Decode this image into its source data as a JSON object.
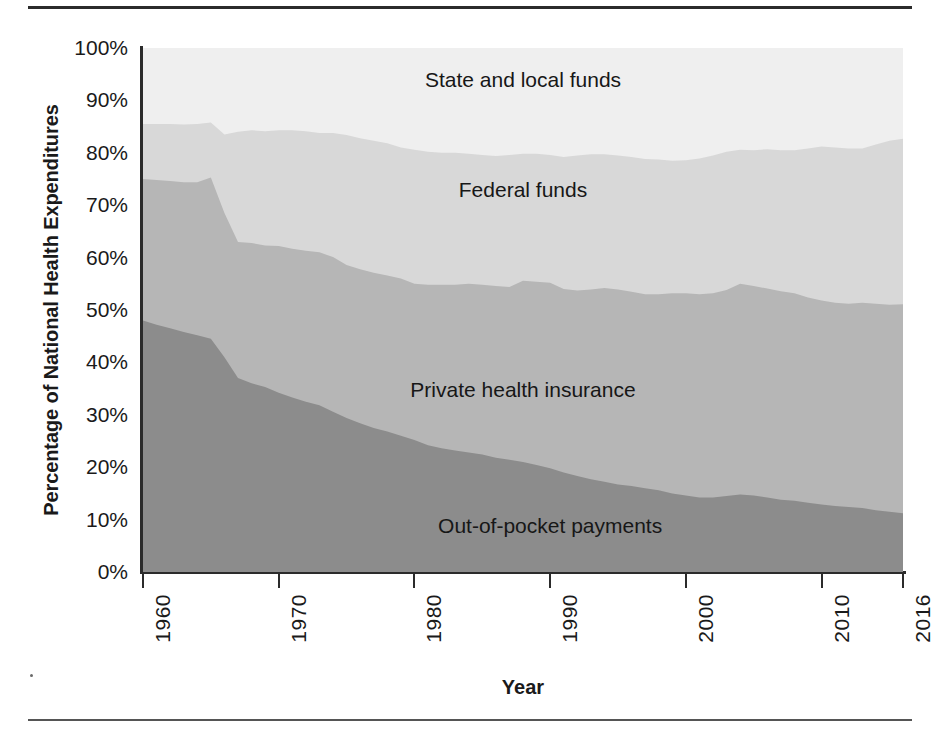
{
  "chart_data": {
    "type": "area",
    "stacked": true,
    "title": "",
    "subtitle": "",
    "xlabel": "Year",
    "ylabel": "Percentage of National Health Expenditures",
    "xlim": [
      1960,
      2016
    ],
    "ylim": [
      0,
      100
    ],
    "grid": false,
    "legend_position": "inline-labels",
    "y_tick_labels": [
      "0%",
      "10%",
      "20%",
      "30%",
      "40%",
      "50%",
      "60%",
      "70%",
      "80%",
      "90%",
      "100%"
    ],
    "y_tick_values": [
      0,
      10,
      20,
      30,
      40,
      50,
      60,
      70,
      80,
      90,
      100
    ],
    "x_tick_labels": [
      "1960",
      "1970",
      "1980",
      "1990",
      "2000",
      "2010",
      "2016"
    ],
    "x_tick_values": [
      1960,
      1970,
      1980,
      1990,
      2000,
      2010,
      2016
    ],
    "x": [
      1960,
      1961,
      1962,
      1963,
      1964,
      1965,
      1966,
      1967,
      1968,
      1969,
      1970,
      1971,
      1972,
      1973,
      1974,
      1975,
      1976,
      1977,
      1978,
      1979,
      1980,
      1981,
      1982,
      1983,
      1984,
      1985,
      1986,
      1987,
      1988,
      1989,
      1990,
      1991,
      1992,
      1993,
      1994,
      1995,
      1996,
      1997,
      1998,
      1999,
      2000,
      2001,
      2002,
      2003,
      2004,
      2005,
      2006,
      2007,
      2008,
      2009,
      2010,
      2011,
      2012,
      2013,
      2014,
      2015,
      2016
    ],
    "series": [
      {
        "name": "Out-of-pocket payments",
        "color": "#8c8c8c",
        "label_x": 1990,
        "label_y": 9,
        "values": [
          48.0,
          47.2,
          46.5,
          45.8,
          45.2,
          44.5,
          41.0,
          37.0,
          36.0,
          35.3,
          34.2,
          33.3,
          32.5,
          31.8,
          30.6,
          29.4,
          28.4,
          27.5,
          26.8,
          26.0,
          25.2,
          24.2,
          23.6,
          23.2,
          22.8,
          22.4,
          21.8,
          21.4,
          21.0,
          20.4,
          19.8,
          19.0,
          18.3,
          17.7,
          17.2,
          16.7,
          16.4,
          16.0,
          15.6,
          15.0,
          14.6,
          14.2,
          14.2,
          14.5,
          14.8,
          14.6,
          14.2,
          13.8,
          13.6,
          13.2,
          12.9,
          12.6,
          12.4,
          12.2,
          11.8,
          11.5,
          11.2
        ]
      },
      {
        "name": "Private health insurance",
        "color": "#b6b6b6",
        "label_x": 1988,
        "label_y": 35,
        "values": [
          27.0,
          27.6,
          28.1,
          28.6,
          29.2,
          30.8,
          27.5,
          26.0,
          26.8,
          27.0,
          28.0,
          28.4,
          28.8,
          29.2,
          29.5,
          29.2,
          29.4,
          29.6,
          29.8,
          30.0,
          29.8,
          30.6,
          31.2,
          31.6,
          32.2,
          32.4,
          32.8,
          33.0,
          34.6,
          35.0,
          35.4,
          35.0,
          35.4,
          36.2,
          37.0,
          37.2,
          37.1,
          37.0,
          37.4,
          38.2,
          38.6,
          38.8,
          39.0,
          39.3,
          40.2,
          40.0,
          39.9,
          39.8,
          39.6,
          39.2,
          38.9,
          38.8,
          38.8,
          39.2,
          39.4,
          39.5,
          39.9
        ]
      },
      {
        "name": "Federal funds",
        "color": "#d8d8d8",
        "label_x": 1988,
        "label_y": 73,
        "values": [
          10.5,
          10.7,
          10.9,
          11.0,
          11.1,
          10.5,
          15.0,
          21.0,
          21.5,
          21.8,
          22.1,
          22.6,
          22.8,
          22.8,
          23.7,
          24.8,
          25.0,
          25.2,
          25.2,
          25.0,
          25.6,
          25.4,
          25.2,
          25.2,
          24.8,
          24.8,
          24.8,
          25.2,
          24.2,
          24.4,
          24.4,
          25.2,
          25.8,
          25.8,
          25.5,
          25.6,
          25.7,
          25.8,
          25.7,
          25.3,
          25.4,
          25.9,
          26.3,
          26.4,
          25.6,
          25.9,
          26.6,
          26.9,
          27.3,
          28.4,
          29.4,
          29.6,
          29.6,
          29.4,
          30.4,
          31.3,
          31.6
        ]
      },
      {
        "name": "State and local funds",
        "color": "#efefef",
        "label_x": 1988,
        "label_y": 94,
        "values": [
          14.5,
          14.5,
          14.5,
          14.6,
          14.5,
          14.2,
          16.5,
          16.0,
          15.7,
          15.9,
          15.7,
          15.7,
          15.9,
          16.2,
          16.2,
          16.6,
          17.2,
          17.7,
          18.2,
          19.0,
          19.4,
          19.8,
          20.0,
          20.0,
          20.2,
          20.4,
          20.6,
          20.4,
          20.2,
          20.2,
          20.4,
          20.8,
          20.5,
          20.3,
          20.3,
          20.5,
          20.8,
          21.2,
          21.3,
          21.5,
          21.4,
          21.1,
          20.5,
          19.8,
          19.4,
          19.5,
          19.3,
          19.5,
          19.5,
          19.2,
          18.8,
          19.0,
          19.2,
          19.2,
          18.4,
          17.7,
          17.3
        ]
      }
    ]
  },
  "axis": {
    "y_title": "Percentage of National Health Expenditures",
    "x_title": "Year"
  }
}
